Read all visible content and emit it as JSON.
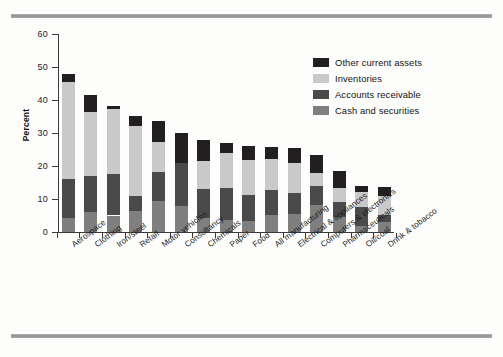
{
  "figure": {
    "top_rule": "horizontal-rule",
    "bottom_rule": "horizontal-rule"
  },
  "chart_data": {
    "type": "bar",
    "stacked": true,
    "title": "",
    "xlabel": "",
    "ylabel": "Percent",
    "ylim": [
      0,
      60
    ],
    "yticks": [
      0,
      10,
      20,
      30,
      40,
      50,
      60
    ],
    "ytick_labels": [
      "0",
      "10",
      "20",
      "30",
      "40",
      "50",
      "60"
    ],
    "grid": false,
    "legend_position": "upper right",
    "categories": [
      "Aerospace",
      "Clothing",
      "Iron/steel",
      "Retail",
      "Motor vehicles",
      "Consultancy",
      "Chemicals",
      "Paper",
      "Food",
      "All manufacturing",
      "Electrical & appliances",
      "Computers & electronics",
      "Pharmaceuticals",
      "Oil/coal",
      "Drink & tobacco"
    ],
    "series": [
      {
        "name": "Cash and securities",
        "color": "#7f7f7f",
        "values": [
          4.3,
          6.0,
          5.0,
          6.5,
          9.5,
          7.8,
          4.3,
          3.6,
          3.3,
          5.1,
          5.5,
          8.1,
          4.4,
          1.7,
          3.0
        ]
      },
      {
        "name": "Accounts receivable",
        "color": "#4a4a4a",
        "values": [
          11.7,
          11.0,
          12.7,
          4.5,
          8.8,
          13.2,
          8.7,
          9.8,
          7.9,
          7.5,
          6.4,
          5.7,
          4.7,
          5.9,
          2.2
        ]
      },
      {
        "name": "Inventories",
        "color": "#c9c9c9",
        "values": [
          29.5,
          19.3,
          19.5,
          21.2,
          9.0,
          0.0,
          8.5,
          10.4,
          10.6,
          9.6,
          9.1,
          4.1,
          4.3,
          4.4,
          5.8
        ]
      },
      {
        "name": "Other current assets",
        "color": "#231f20",
        "values": [
          2.5,
          5.3,
          1.1,
          3.0,
          6.2,
          9.0,
          6.5,
          3.2,
          4.2,
          3.6,
          4.5,
          5.3,
          5.1,
          2.0,
          2.5
        ]
      }
    ],
    "totals": [
      48.0,
      41.6,
      38.3,
      35.2,
      33.5,
      30.0,
      28.0,
      27.0,
      26.0,
      25.8,
      25.5,
      23.2,
      18.5,
      14.0,
      13.5
    ]
  },
  "legend": {
    "items": [
      {
        "label": "Other current assets",
        "color": "#231f20"
      },
      {
        "label": "Inventories",
        "color": "#c9c9c9"
      },
      {
        "label": "Accounts receivable",
        "color": "#4a4a4a"
      },
      {
        "label": "Cash and securities",
        "color": "#7f7f7f"
      }
    ]
  }
}
